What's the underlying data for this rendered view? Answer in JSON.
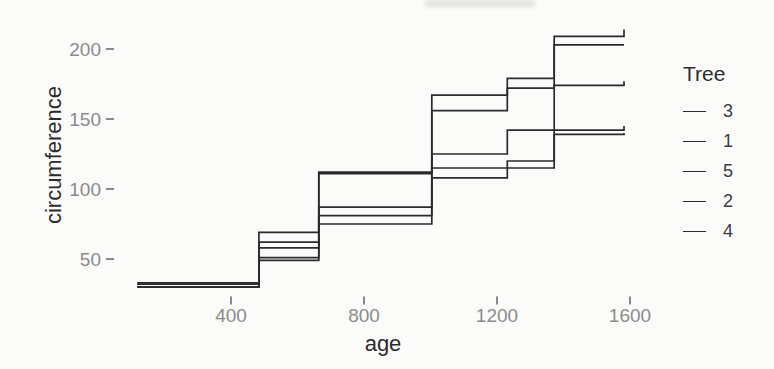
{
  "chart_data": {
    "type": "line",
    "step": "hv",
    "title": "",
    "xlabel": "age",
    "ylabel": "circumference",
    "x": [
      118,
      484,
      664,
      1004,
      1231,
      1372,
      1582
    ],
    "series": [
      {
        "name": "3",
        "values": [
          30,
          51,
          75,
          108,
          115,
          139,
          140
        ]
      },
      {
        "name": "1",
        "values": [
          30,
          58,
          87,
          115,
          120,
          142,
          145
        ]
      },
      {
        "name": "5",
        "values": [
          30,
          49,
          81,
          125,
          142,
          174,
          177
        ]
      },
      {
        "name": "2",
        "values": [
          33,
          69,
          111,
          156,
          172,
          203,
          203
        ]
      },
      {
        "name": "4",
        "values": [
          32,
          62,
          112,
          167,
          179,
          209,
          214
        ]
      }
    ],
    "xticks": [
      400,
      800,
      1200,
      1600
    ],
    "yticks": [
      50,
      100,
      150,
      200
    ],
    "xlim": [
      45,
      1655
    ],
    "ylim": [
      21,
      223
    ],
    "grid": false,
    "legend_title": "Tree",
    "legend_position": "right",
    "legend_items": [
      "3",
      "1",
      "5",
      "2",
      "4"
    ],
    "line_color": "#2b2b2b",
    "tick_label_color": "#8c8c8c",
    "tick_mark_color": "#6e6e6e",
    "axis_label_color": "#2b2b2b",
    "background_color": "#fbfbf9"
  }
}
